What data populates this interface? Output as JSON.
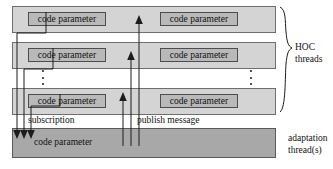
{
  "diagram": {
    "colors": {
      "hoc_bar_fill": "#d4d4d4",
      "adaptation_bar_fill": "#a8a8a8",
      "code_box_fill": "#b9b9b9",
      "stroke": "#1c1c1c",
      "background": "#ffffff"
    },
    "hoc_rows": [
      {
        "row_id": "row-1",
        "boxes": [
          {
            "label": "code parameter"
          },
          {
            "label": "code parameter"
          }
        ]
      },
      {
        "row_id": "row-2",
        "boxes": [
          {
            "label": "code parameter"
          },
          {
            "label": "code parameter"
          }
        ]
      },
      {
        "row_id": "row-3",
        "boxes": [
          {
            "label": "code parameter"
          },
          {
            "label": "code parameter"
          }
        ]
      }
    ],
    "ellipsis": {
      "left": "⋮",
      "right": "⋮",
      "dot_count": 3
    },
    "adaptation": {
      "label": "code parameter"
    },
    "flow_labels": {
      "subscription": "subscription",
      "publish": "publish message"
    },
    "annotations": {
      "hoc_line1": "HOC",
      "hoc_line2": "threads",
      "adaptation_line1": "adaptation",
      "adaptation_line2": "thread(s)"
    }
  }
}
